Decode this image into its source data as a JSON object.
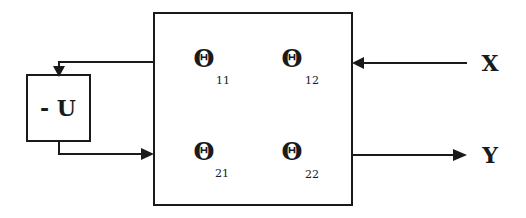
{
  "diagram": {
    "type": "block-diagram",
    "main_block": {
      "elements": [
        {
          "symbol": "Θ",
          "subscript": "11"
        },
        {
          "symbol": "Θ",
          "subscript": "12"
        },
        {
          "symbol": "Θ",
          "subscript": "21"
        },
        {
          "symbol": "Θ",
          "subscript": "22"
        }
      ]
    },
    "feedback_block": {
      "label": "- U"
    },
    "input": {
      "label": "X"
    },
    "output": {
      "label": "Y"
    },
    "connections": [
      {
        "from": "main_block",
        "to": "feedback_block",
        "direction": "left-then-down"
      },
      {
        "from": "feedback_block",
        "to": "main_block",
        "direction": "down-then-right"
      },
      {
        "from": "X",
        "to": "main_block"
      },
      {
        "from": "main_block",
        "to": "Y"
      }
    ],
    "colors": {
      "stroke": "#1a1a1a",
      "background": "#ffffff"
    }
  }
}
